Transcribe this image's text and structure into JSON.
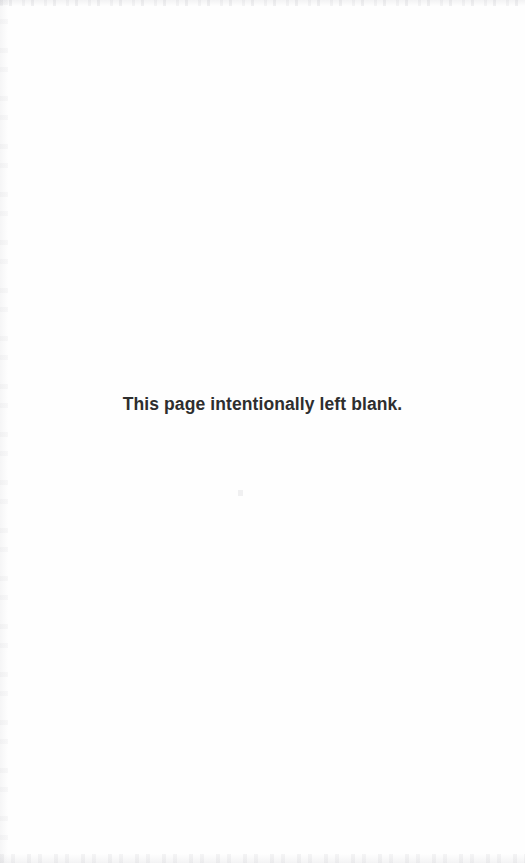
{
  "page": {
    "background_color": "#fefefe",
    "width": 525,
    "height": 863,
    "notice_text": "This page intentionally left blank.",
    "notice_color": "#2e2e2e"
  },
  "artifacts": {
    "top_edge_label": "scan-noise-top",
    "bottom_edge_label": "scan-noise-bottom",
    "left_edge_label": "scan-noise-left",
    "speck_label": "scan-speck"
  }
}
